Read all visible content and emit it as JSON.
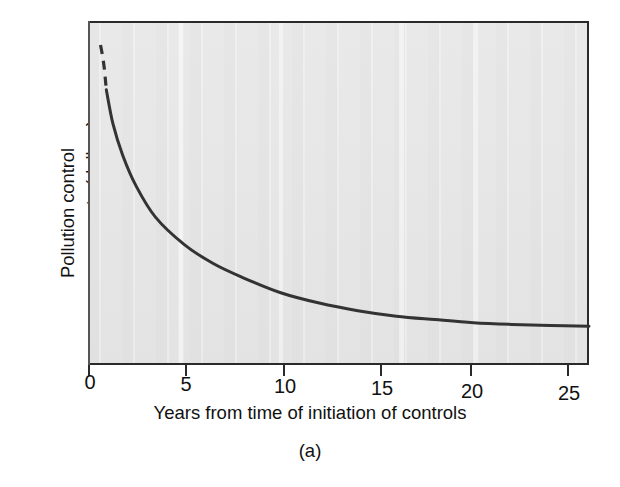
{
  "figure": {
    "caption": "(a)",
    "background_color": "#ffffff",
    "panel_color": "#e6e6e6",
    "curve_color": "#333333"
  },
  "axes": {
    "xlabel": "Years from time of initiation of controls",
    "ylabel_line1": "Pollution control",
    "ylabel_line2": "per year costs (dollars)",
    "xticklabels": [
      "0",
      "5",
      "10",
      "15",
      "20",
      "25"
    ]
  },
  "chart_data": {
    "type": "line",
    "title": "",
    "subtitle": "",
    "caption": "(a)",
    "xlabel": "Years from time of initiation of controls",
    "ylabel": "Pollution control per year costs (dollars)",
    "xlim": [
      0,
      26
    ],
    "ylim": [
      0,
      100
    ],
    "xticks": [
      0,
      5,
      10,
      15,
      20,
      25
    ],
    "xticklabels": [
      "0",
      "5",
      "10",
      "15",
      "20",
      "25"
    ],
    "yticks": [],
    "yticklabels": [],
    "grid": false,
    "legend": null,
    "series": [
      {
        "name": "Pollution control cost per year",
        "style": "dashed",
        "note": "extrapolated initial segment near year 0-1",
        "x": [
          0.65,
          0.75,
          0.85,
          0.95
        ],
        "y": [
          93.0,
          90.0,
          86.0,
          80.0
        ]
      },
      {
        "name": "Pollution control cost per year",
        "style": "solid",
        "x": [
          0.95,
          1.3,
          1.8,
          2.5,
          3.5,
          5.0,
          6.5,
          8.0,
          10.0,
          12.0,
          14.0,
          16.0,
          18.0,
          20.0,
          22.0,
          24.0,
          26.0
        ],
        "y": [
          80.0,
          70.0,
          61.0,
          52.0,
          43.0,
          35.0,
          29.5,
          25.5,
          21.0,
          18.0,
          15.8,
          14.2,
          13.2,
          12.3,
          11.8,
          11.5,
          11.3
        ]
      }
    ],
    "annotations": [
      {
        "text": "curve decays asymptotically toward a low constant cost",
        "visible": false
      }
    ]
  }
}
